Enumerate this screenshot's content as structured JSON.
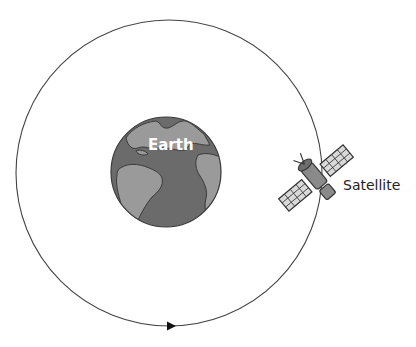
{
  "diagram": {
    "type": "orbit-illustration",
    "labels": {
      "earth": "Earth",
      "satellite": "Satellite"
    },
    "orbit": {
      "shape": "circle",
      "direction": "counterclockwise-at-bottom-pointing-right",
      "arrow_count": 1
    },
    "colors": {
      "ocean": "#6b6b6b",
      "land": "#9a9a9a",
      "outline": "#3a3a3a",
      "orbit_line": "#444444",
      "satellite_body": "#8a8a8a",
      "solar_panel": "#d9d9d9",
      "background": "#ffffff"
    }
  }
}
